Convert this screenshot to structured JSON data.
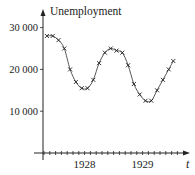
{
  "chart_data": {
    "type": "line",
    "title": "",
    "xlabel": "t",
    "ylabel": "Unemployment",
    "x_unit": "months",
    "x_tick_labels": [
      {
        "label": "1928",
        "month_index": 7
      },
      {
        "label": "1929",
        "month_index": 17
      }
    ],
    "y_ticks": [
      {
        "label": "10 000",
        "value": 10000
      },
      {
        "label": "20 000",
        "value": 20000
      },
      {
        "label": "30 000",
        "value": 30000
      }
    ],
    "ylim": [
      0,
      36000
    ],
    "xlim": [
      0,
      24
    ],
    "grid": false,
    "series": [
      {
        "name": "Unemployment (observed)",
        "marker": "x",
        "x": [
          0.5,
          1.5,
          2.5,
          3.5,
          4.5,
          5.5,
          6.5,
          7.5,
          8.5,
          9.5,
          10.5,
          11.5,
          12.5,
          13.5,
          14.5,
          15.5,
          16.5,
          17.5,
          18.5,
          19.5,
          20.5,
          21.5,
          22.3
        ],
        "values": [
          28000,
          28000,
          27000,
          25000,
          20000,
          17000,
          15500,
          15500,
          17500,
          21500,
          24000,
          25000,
          24500,
          24000,
          21000,
          16500,
          14000,
          12500,
          12500,
          15000,
          17500,
          20000,
          22000
        ]
      },
      {
        "name": "Fitted sinusoid",
        "style": "smooth-line"
      }
    ]
  }
}
